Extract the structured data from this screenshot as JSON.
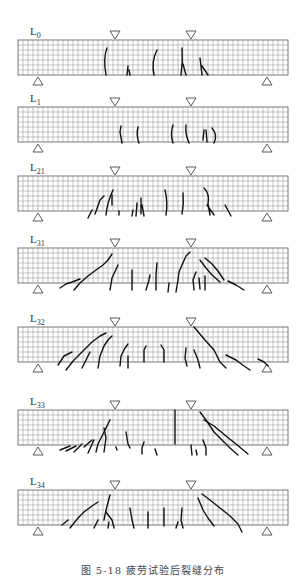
{
  "figure": {
    "caption": "图 5-18   疲劳试验后裂缝分布",
    "beam_geometry": {
      "x_left": 18,
      "x_right": 288,
      "height": 35,
      "cell": 5,
      "load_points_x": [
        115,
        191
      ],
      "support_points_x": [
        38,
        267
      ]
    },
    "beams": [
      {
        "id": "L0",
        "base": "L",
        "sub": "0",
        "top": 40,
        "cracks": [
          "M107 48 Q103 58 106 75",
          "M128 66 L127 75 M129 70 L130 75",
          "M157 50 Q151 62 154 75",
          "M182 48 Q183 62 181 75 M183 64 L186 75",
          "M200 58 L202 75 M202 66 L208 75"
        ]
      },
      {
        "id": "L1",
        "base": "L",
        "sub": "1",
        "top": 107,
        "cracks": [
          "M121 126 L120 132 L122 143",
          "M138 127 Q136 135 139 143",
          "M173 125 Q170 134 173 143",
          "M186 125 Q185 134 189 143",
          "M204 130 L203 140 M206 130 L207 142",
          "M212 128 Q218 135 214 143"
        ]
      },
      {
        "id": "L21",
        "base": "L",
        "sub": "21",
        "top": 176,
        "cracks": [
          "M88 218 L92 210",
          "M95 214 L100 200 L104 196",
          "M106 215 Q107 203 113 190",
          "M112 205 L112 195",
          "M119 211 L119 215",
          "M133 210 L132 216 M137 203 L136 216",
          "M141 198 L141 214 M142 205 L144 216",
          "M165 190 Q168 202 166 215",
          "M183 193 Q184 204 182 214",
          "M204 188 Q210 194 208 204 L210 215 M207 205 L214 215",
          "M225 205 L231 216"
        ]
      },
      {
        "id": "L31",
        "base": "L",
        "sub": "31",
        "top": 248,
        "cracks": [
          "M60 288 L66 284 L72 282 L80 279",
          "M74 290 L80 283 L88 276 L96 270 L103 265 L108 260 L112 254",
          "M110 290 L112 278 L118 265",
          "M132 290 L132 270",
          "M146 290 L149 280 L150 275",
          "M156 290 L156 275 L157 263",
          "M168 292 L169 283",
          "M176 292 L178 280 L179 272 L182 265 L186 256 L190 252",
          "M194 290 L193 280 L196 272",
          "M200 289 L199 278",
          "M205 290 L205 276",
          "M200 260 L206 268 L212 275 L220 282",
          "M205 258 L212 264 L218 271 L224 280",
          "M228 281 L236 285 L244 290"
        ]
      },
      {
        "id": "L32",
        "base": "L",
        "sub": "32",
        "top": 327,
        "cracks": [
          "M58 365 L64 356 L72 352",
          "M66 370 L74 360 L82 352 L92 342 L100 336 L106 333",
          "M82 368 L86 360 L90 352",
          "M98 368 L100 356 L104 346 L108 340 L112 336",
          "M120 366 L121 356 L125 348 L128 344",
          "M128 368 L128 356",
          "M144 362 L144 350 L146 346",
          "M164 362 L164 350 L161 345",
          "M187 366 L185 358 L186 348",
          "M194 350 L198 360 L200 368",
          "M194 327 L205 340 L214 350 L220 362 L226 368",
          "M226 355 L236 360 L244 366 L250 370",
          "M258 359 L264 362 L268 366"
        ]
      },
      {
        "id": "L33",
        "base": "L",
        "sub": "33",
        "top": 410,
        "cracks": [
          "M60 450 L70 446",
          "M66 451 L76 446",
          "M74 452 L82 444",
          "M84 447 L92 440",
          "M88 453 L94 440",
          "M96 452 L98 444 L104 432 L110 420",
          "M104 452 L106 438 L104 428",
          "M116 447 L117 450",
          "M126 432 L128 444 L130 448",
          "M142 454 L142 448 L144 442",
          "M155 449 L157 455",
          "M175 444 L175 410",
          "M191 445 L192 455 M196 450 L197 455",
          "M203 440 L206 448 L206 455",
          "M200 412 L206 420 L214 432 L222 440 L230 448 L238 455",
          "M204 420 L214 426 L226 436 L236 444 L248 454"
        ]
      },
      {
        "id": "L34",
        "base": "L",
        "sub": "34",
        "top": 490,
        "cracks": [
          "M62 525 L68 520",
          "M70 528 L78 518 L84 512 L92 506 L98 502",
          "M94 528 L98 520",
          "M104 520 L106 510 L110 495",
          "M106 512 L112 520 L114 528",
          "M109 522 L108 528",
          "M130 508 L132 520 L134 528",
          "M148 512 L148 528",
          "M164 508 L164 526",
          "M176 528 L178 522",
          "M182 508 L181 520 L183 528",
          "M198 498 L203 510 L208 518 L214 526",
          "M202 494 L210 500 L220 508 L230 516 L238 524 L242 532"
        ]
      }
    ]
  }
}
